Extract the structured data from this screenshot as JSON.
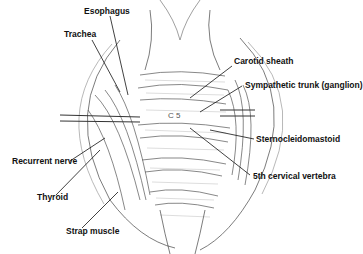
{
  "diagram": {
    "labels": {
      "esophagus": "Esophagus",
      "trachea": "Trachea",
      "carotid_sheath": "Carotid sheath",
      "sympathetic_trunk": "Sympathetic trunk (ganglion)",
      "recurrent_nerve": "Recurrent nerve",
      "sternocleidomastoid": "Sternocleidomastoid",
      "thyroid": "Thyroid",
      "fifth_cervical_vertebra": "5th cervical vertebra",
      "strap_muscle": "Strap muscle",
      "vertebra_marker": "C5"
    },
    "colors": {
      "ink": "#111111",
      "background": "#ffffff",
      "shade": "#bbbbbb"
    }
  }
}
